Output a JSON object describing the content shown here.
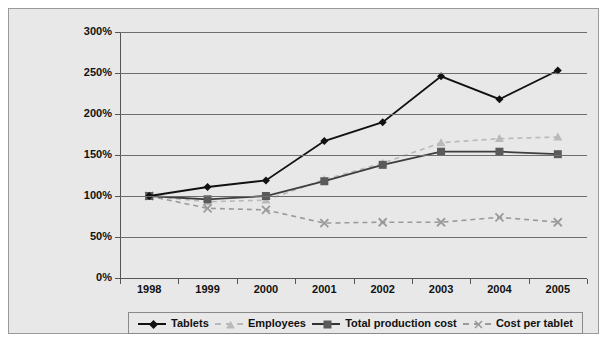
{
  "chart_data": {
    "type": "line",
    "title": "",
    "xlabel": "",
    "ylabel": "Values indexed to 1998",
    "categories": [
      "1998",
      "1999",
      "2000",
      "2001",
      "2002",
      "2003",
      "2004",
      "2005"
    ],
    "ylim": [
      0,
      300
    ],
    "ytick_labels": [
      "0%",
      "50%",
      "100%",
      "150%",
      "200%",
      "250%",
      "300%"
    ],
    "ytick_values": [
      0,
      50,
      100,
      150,
      200,
      250,
      300
    ],
    "grid": true,
    "legend_position": "bottom",
    "series": [
      {
        "name": "Tablets",
        "marker": "diamond",
        "line_style": "solid",
        "color": "#111111",
        "values": [
          100,
          111,
          119,
          167,
          190,
          246,
          218,
          253
        ]
      },
      {
        "name": "Employees",
        "marker": "triangle",
        "line_style": "dashed",
        "color": "#b9b9b9",
        "values": [
          100,
          93,
          95,
          120,
          140,
          165,
          170,
          172
        ]
      },
      {
        "name": "Total production cost",
        "marker": "square",
        "line_style": "solid",
        "color": "#5a5a5a",
        "values": [
          100,
          96,
          100,
          118,
          138,
          154,
          154,
          151
        ]
      },
      {
        "name": "Cost per tablet",
        "marker": "cross",
        "line_style": "dashed",
        "color": "#9a9a9a",
        "values": [
          100,
          85,
          83,
          67,
          68,
          68,
          74,
          68
        ]
      }
    ]
  },
  "legend": {
    "items": [
      {
        "label": "Tablets"
      },
      {
        "label": "Employees"
      },
      {
        "label": "Total production cost"
      },
      {
        "label": "Cost per tablet"
      }
    ]
  },
  "colors": {
    "background": "#e8e8e8",
    "grid": "#6d6d6d",
    "axis": "#555555",
    "tablets": "#111111",
    "employees": "#b9b9b9",
    "production_cost": "#5a5a5a",
    "cost_per_tablet": "#9a9a9a"
  }
}
